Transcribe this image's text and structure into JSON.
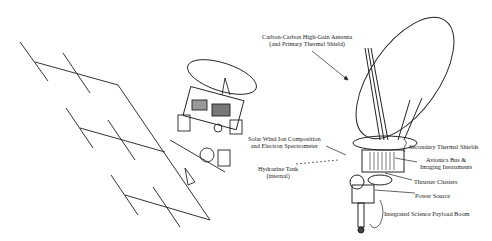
{
  "diagram": {
    "type": "spacecraft-illustration",
    "left_figure": "Spacecraft with deployed solar arrays and dish antenna",
    "right_figure": "Spacecraft with high-gain antenna used as thermal shield",
    "labels": {
      "antenna": [
        "Carbon-Carbon High-Gain Antenna",
        "(and Primary Thermal Shield)"
      ],
      "solar_wind": [
        "Solar Wind Ion Composition",
        "and Electron Spectrometer"
      ],
      "hydrazine": [
        "Hydrazine Tank",
        "(internal)"
      ],
      "secondary_shields": "Secondary Thermal Shields",
      "avionics": [
        "Avionics Bus &",
        "Imaging Instruments"
      ],
      "thrusters": "Thruster Clusters",
      "power": "Power Source",
      "boom": "Integrated Science Payload Boom"
    }
  }
}
